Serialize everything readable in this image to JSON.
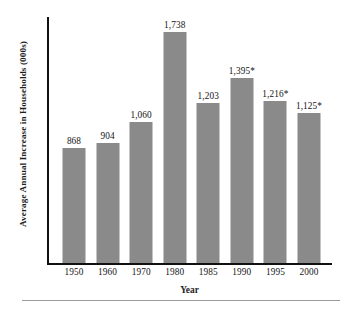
{
  "chart_data": {
    "type": "bar",
    "title": "",
    "xlabel": "Year",
    "ylabel": "Average Annual Increase in Households (000s)",
    "categories": [
      "1950",
      "1960",
      "1970",
      "1980",
      "1985",
      "1990",
      "1995",
      "2000"
    ],
    "values": [
      868,
      904,
      1060,
      1738,
      1203,
      1395,
      1216,
      1125
    ],
    "data_labels": [
      "868",
      "904",
      "1,060",
      "1,738",
      "1,203",
      "1,395*",
      "1,216*",
      "1,125*"
    ],
    "ylim": [
      0,
      1850
    ],
    "grid": false,
    "legend": null,
    "bar_color": "#8a8a8a",
    "axis_color": "#111111",
    "text_color": "#141414",
    "footnote_marker": "*"
  },
  "axes": {
    "y_title": "Average Annual Increase in Households (000s)",
    "x_title": "Year"
  }
}
